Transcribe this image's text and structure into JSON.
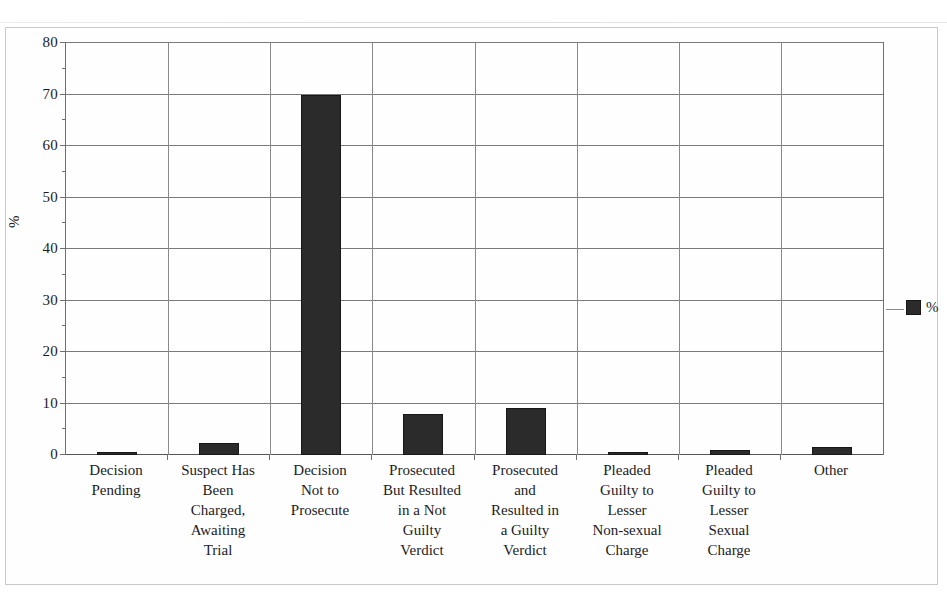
{
  "chart_data": {
    "type": "bar",
    "title": "",
    "subtitle": "",
    "xlabel": "",
    "ylabel": "%",
    "ylim": [
      0,
      80
    ],
    "ytick_step": 10,
    "yticks": [
      0,
      10,
      20,
      30,
      40,
      50,
      60,
      70,
      80
    ],
    "minor_tick_step": 5,
    "grid": "horizontal-and-category-separators",
    "legend": {
      "position": "right",
      "entries": [
        {
          "label": "%",
          "color": "#2b2b2b",
          "marker": "square"
        }
      ]
    },
    "categories": [
      "Decision Pending",
      "Suspect Has Been Charged, Awaiting Trial",
      "Decision Not to Prosecute",
      "Prosecuted But Resulted in a Not Guilty Verdict",
      "Prosecuted and Resulted in a Guilty Verdict",
      "Pleaded Guilty to Lesser Non-sexual Charge",
      "Pleaded Guilty to Lesser Sexual Charge",
      "Other"
    ],
    "category_lines": [
      [
        "Decision",
        "Pending"
      ],
      [
        "Suspect Has",
        "Been",
        "Charged,",
        "Awaiting",
        "Trial"
      ],
      [
        "Decision",
        "Not to",
        "Prosecute"
      ],
      [
        "Prosecuted",
        "But Resulted",
        "in a Not",
        "Guilty",
        "Verdict"
      ],
      [
        "Prosecuted",
        "and",
        "Resulted in",
        "a Guilty",
        "Verdict"
      ],
      [
        "Pleaded",
        "Guilty to",
        "Lesser",
        "Non-sexual",
        "Charge"
      ],
      [
        "Pleaded",
        "Guilty to",
        "Lesser",
        "Sexual",
        "Charge"
      ],
      [
        "Other"
      ]
    ],
    "series": [
      {
        "name": "%",
        "color": "#2b2b2b",
        "values": [
          0.3,
          2.3,
          70.0,
          8.0,
          9.1,
          0.4,
          0.9,
          1.6
        ]
      }
    ]
  },
  "axis": {
    "y_title": "%",
    "y_tick_labels": [
      "80",
      "70",
      "60",
      "50",
      "40",
      "30",
      "20",
      "10",
      "0"
    ]
  },
  "legend": {
    "label": "%"
  }
}
